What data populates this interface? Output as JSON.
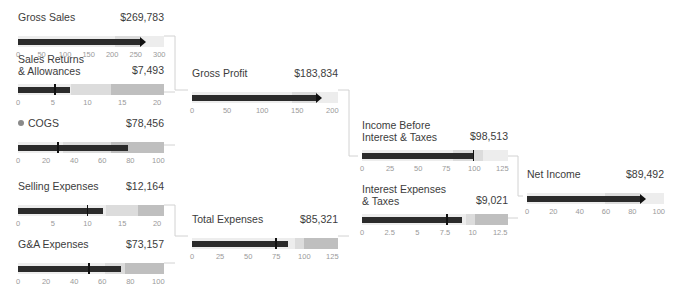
{
  "chart_data": {
    "type": "bar",
    "subtype": "bullet-chart-waterfall",
    "title": "",
    "currency_unit": "thousands",
    "grid": false,
    "legend": null,
    "charts": [
      {
        "id": "gross-sales",
        "label": "Gross Sales",
        "value_text": "$269,783",
        "value": 269.783,
        "marker": "arrow",
        "has_dot": false,
        "ticks": [
          "0",
          "50",
          "100",
          "150",
          "200",
          "250",
          "300"
        ],
        "tick_values": [
          0,
          50,
          100,
          150,
          200,
          250,
          300
        ],
        "xlim": [
          0,
          310
        ],
        "bands": [
          {
            "to": 205,
            "shade": "b1"
          },
          {
            "to": 262,
            "shade": "b2"
          },
          {
            "to": 310,
            "shade": "b1"
          }
        ],
        "x": 18,
        "y": 12,
        "w": 146
      },
      {
        "id": "sales-returns-allowances",
        "label": "Sales Returns\n& Allowances",
        "value_text": "$7,493",
        "value": 7.493,
        "marker": "tick",
        "tick_at": 5.2,
        "has_dot": false,
        "ticks": [
          "0",
          "5",
          "10",
          "15",
          "20"
        ],
        "tick_values": [
          0,
          5,
          10,
          15,
          20
        ],
        "xlim": [
          0,
          21
        ],
        "bands": [
          {
            "to": 7.6,
            "shade": "b1"
          },
          {
            "to": 13.4,
            "shade": "b2"
          },
          {
            "to": 21,
            "shade": "b3"
          }
        ],
        "x": 18,
        "y": 60,
        "w": 146
      },
      {
        "id": "cogs",
        "label": "COGS",
        "value_text": "$78,456",
        "value": 78.456,
        "marker": "tick",
        "tick_at": 28,
        "has_dot": true,
        "ticks": [
          "0",
          "20",
          "40",
          "60",
          "80",
          "100"
        ],
        "tick_values": [
          0,
          20,
          40,
          60,
          80,
          100
        ],
        "xlim": [
          0,
          104
        ],
        "bands": [
          {
            "to": 32,
            "shade": "b1"
          },
          {
            "to": 66,
            "shade": "b2"
          },
          {
            "to": 104,
            "shade": "b3"
          }
        ],
        "x": 18,
        "y": 118,
        "w": 146
      },
      {
        "id": "selling-expenses",
        "label": "Selling Expenses",
        "value_text": "$12,164",
        "value": 12.164,
        "marker": "tick",
        "tick_at": 9.9,
        "has_dot": false,
        "ticks": [
          "0",
          "5",
          "10",
          "15",
          "20"
        ],
        "tick_values": [
          0,
          5,
          10,
          15,
          20
        ],
        "xlim": [
          0,
          21
        ],
        "bands": [
          {
            "to": 12.6,
            "shade": "b1"
          },
          {
            "to": 17.2,
            "shade": "b2"
          },
          {
            "to": 21,
            "shade": "b3"
          }
        ],
        "x": 18,
        "y": 181,
        "w": 146
      },
      {
        "id": "ga-expenses",
        "label": "G&A Expenses",
        "value_text": "$73,157",
        "value": 73.157,
        "marker": "tick",
        "tick_at": 50,
        "has_dot": false,
        "ticks": [
          "0",
          "20",
          "40",
          "60",
          "80",
          "100"
        ],
        "tick_values": [
          0,
          20,
          40,
          60,
          80,
          100
        ],
        "xlim": [
          0,
          104
        ],
        "bands": [
          {
            "to": 62,
            "shade": "b1"
          },
          {
            "to": 76,
            "shade": "b2"
          },
          {
            "to": 104,
            "shade": "b3"
          }
        ],
        "x": 18,
        "y": 239,
        "w": 146
      },
      {
        "id": "gross-profit",
        "label": "Gross Profit",
        "value_text": "$183,834",
        "value": 183.834,
        "marker": "arrow",
        "has_dot": false,
        "ticks": [
          "0",
          "50",
          "100",
          "150",
          "200"
        ],
        "tick_values": [
          0,
          50,
          100,
          150,
          200
        ],
        "xlim": [
          0,
          208
        ],
        "bands": [
          {
            "to": 142,
            "shade": "b1"
          },
          {
            "to": 178,
            "shade": "b2"
          },
          {
            "to": 208,
            "shade": "b1"
          }
        ],
        "x": 192,
        "y": 68,
        "w": 146
      },
      {
        "id": "total-expenses",
        "label": "Total Expenses",
        "value_text": "$85,321",
        "value": 85.321,
        "marker": "tick",
        "tick_at": 74,
        "has_dot": false,
        "ticks": [
          "0",
          "25",
          "50",
          "75",
          "100",
          "125"
        ],
        "tick_values": [
          0,
          25,
          50,
          75,
          100,
          125
        ],
        "xlim": [
          0,
          130
        ],
        "bands": [
          {
            "to": 92,
            "shade": "b1"
          },
          {
            "to": 100,
            "shade": "b2"
          },
          {
            "to": 130,
            "shade": "b3"
          }
        ],
        "x": 192,
        "y": 214,
        "w": 146
      },
      {
        "id": "income-before-interest-taxes",
        "label": "Income Before\nInterest & Taxes",
        "value_text": "$98,513",
        "value": 98.513,
        "marker": "tick",
        "tick_at": 98.513,
        "has_dot": false,
        "ticks": [
          "0",
          "25",
          "50",
          "75",
          "100",
          "125"
        ],
        "tick_values": [
          0,
          25,
          50,
          75,
          100,
          125
        ],
        "xlim": [
          0,
          130
        ],
        "bands": [
          {
            "to": 81,
            "shade": "b1"
          },
          {
            "to": 108,
            "shade": "b2"
          },
          {
            "to": 130,
            "shade": "b1"
          }
        ],
        "x": 362,
        "y": 126,
        "w": 146
      },
      {
        "id": "interest-expenses-taxes",
        "label": "Interest Expenses\n& Taxes",
        "value_text": "$9,021",
        "value": 9.021,
        "marker": "tick",
        "tick_at": 7.6,
        "has_dot": false,
        "ticks": [
          "0",
          "2.5",
          "5",
          "7.5",
          "10",
          "12.5"
        ],
        "tick_values": [
          0,
          2.5,
          5,
          7.5,
          10,
          12.5
        ],
        "xlim": [
          0,
          13.2
        ],
        "bands": [
          {
            "to": 9.4,
            "shade": "b1"
          },
          {
            "to": 10.2,
            "shade": "b2"
          },
          {
            "to": 13.2,
            "shade": "b3"
          }
        ],
        "x": 362,
        "y": 190,
        "w": 146
      },
      {
        "id": "net-income",
        "label": "Net Income",
        "value_text": "$89,492",
        "value": 89.492,
        "marker": "arrow",
        "has_dot": false,
        "ticks": [
          "0",
          "20",
          "40",
          "60",
          "80",
          "100"
        ],
        "tick_values": [
          0,
          20,
          40,
          60,
          80,
          100
        ],
        "xlim": [
          0,
          104
        ],
        "bands": [
          {
            "to": 59,
            "shade": "b1"
          },
          {
            "to": 86,
            "shade": "b2"
          },
          {
            "to": 104,
            "shade": "b1"
          }
        ],
        "x": 527,
        "y": 169,
        "w": 137
      }
    ],
    "connectors": [
      {
        "from": [
          "gross-sales",
          "sales-returns-allowances",
          "cogs"
        ],
        "to": "gross-profit"
      },
      {
        "from": [
          "selling-expenses",
          "ga-expenses"
        ],
        "to": "total-expenses"
      },
      {
        "from": [
          "gross-profit",
          "total-expenses"
        ],
        "to": "income-before-interest-taxes"
      },
      {
        "from": [
          "income-before-interest-taxes",
          "interest-expenses-taxes"
        ],
        "to": "net-income"
      }
    ]
  }
}
